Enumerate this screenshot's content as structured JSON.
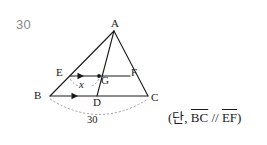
{
  "question": {
    "number": "30"
  },
  "figure": {
    "type": "geometry-diagram",
    "shape": "triangle",
    "vertices": {
      "A": {
        "label": "A",
        "x": 114,
        "y": 30
      },
      "B": {
        "label": "B",
        "x": 50,
        "y": 96
      },
      "C": {
        "label": "C",
        "x": 148,
        "y": 96
      }
    },
    "points": {
      "D": {
        "label": "D",
        "x": 97,
        "y": 96
      },
      "E": {
        "label": "E",
        "x": 70,
        "y": 76
      },
      "F": {
        "label": "F",
        "x": 130,
        "y": 76
      },
      "G": {
        "label": "G",
        "x": 99,
        "y": 76
      }
    },
    "segments": [
      {
        "name": "AB",
        "from": "A",
        "to": "B"
      },
      {
        "name": "AC",
        "from": "A",
        "to": "C"
      },
      {
        "name": "BC",
        "from": "B",
        "to": "C"
      },
      {
        "name": "AD",
        "from": "A",
        "to": "D"
      },
      {
        "name": "EF",
        "from": "E",
        "to": "F"
      }
    ],
    "parallel_marks": [
      {
        "on": "EF",
        "glyph": "single-arrow-right"
      },
      {
        "on": "BC",
        "glyph": "single-arrow-right"
      }
    ],
    "measures": {
      "eg": {
        "label": "x",
        "segment": "EG",
        "style": "italic",
        "leader": "dashed"
      },
      "bc": {
        "label": "30",
        "segment": "BC",
        "leader": "dashed-arc"
      }
    }
  },
  "condition": {
    "prefix": "(단, ",
    "term1": "BC",
    "operator": " // ",
    "term2": "EF",
    "suffix": ")"
  },
  "colors": {
    "ink": "#1a1a1a",
    "muted": "#8a8a8a",
    "background": "#ffffff"
  }
}
